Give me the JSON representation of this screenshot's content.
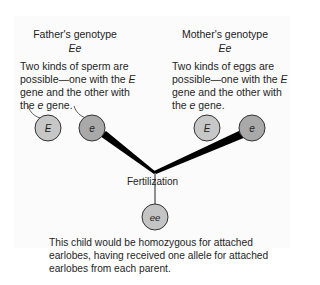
{
  "father": {
    "heading": "Father's genotype",
    "genotype": "Ee",
    "description_parts": [
      "Two kinds of sperm are possible—one with the ",
      "E",
      " gene and the other with the ",
      "e",
      " gene."
    ],
    "gametes": [
      {
        "allele": "E",
        "fill": "#c7c7c7"
      },
      {
        "allele": "e",
        "fill": "#a9a9a9"
      }
    ]
  },
  "mother": {
    "heading": "Mother's genotype",
    "genotype": "Ee",
    "description_parts": [
      "Two kinds of eggs are possible—one with the ",
      "E",
      " gene and the other with the ",
      "e",
      " gene."
    ],
    "gametes": [
      {
        "allele": "E",
        "fill": "#c7c7c7"
      },
      {
        "allele": "e",
        "fill": "#a9a9a9"
      }
    ]
  },
  "fertilization_label": "Fertilization",
  "child": {
    "genotype": "ee",
    "fill": "#c4c4c4",
    "description": "This child would be homozygous for attached earlobes, having received one allele for attached earlobes from each parent."
  },
  "colors": {
    "panel_bg": "#fbfbfb",
    "circle_stroke": "#333333",
    "wedge": "#000000"
  }
}
